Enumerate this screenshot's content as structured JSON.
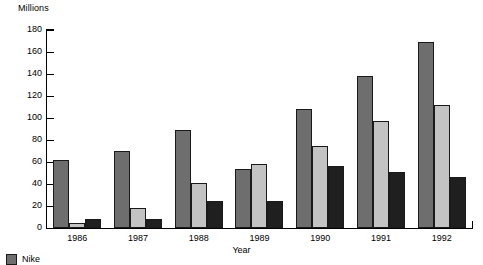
{
  "chart_data": {
    "type": "bar",
    "title": "",
    "subtitle": "",
    "ylabel": "Millions",
    "xlabel": "Year",
    "ylim": [
      0,
      180
    ],
    "ytick_step": 20,
    "yticks": [
      "180",
      "160",
      "140",
      "120",
      "100",
      "80",
      "60",
      "40",
      "20",
      "0"
    ],
    "grid": false,
    "legend_position": "bottom-left",
    "categories": [
      "1986",
      "1987",
      "1988",
      "1989",
      "1990",
      "1991",
      "1992"
    ],
    "series": [
      {
        "name": "Nike",
        "color": "#6e6e6e",
        "values": [
          62,
          70,
          89,
          54,
          108,
          138,
          169
        ]
      },
      {
        "name": "",
        "color": "#c3c3c3",
        "values": [
          5,
          18,
          41,
          58,
          75,
          97,
          112
        ]
      },
      {
        "name": "",
        "color": "#1f1f1f",
        "values": [
          8,
          8,
          25,
          25,
          56,
          51,
          46
        ]
      }
    ]
  },
  "legend": {
    "items": [
      {
        "label": "Nike",
        "color": "#6e6e6e"
      }
    ]
  }
}
